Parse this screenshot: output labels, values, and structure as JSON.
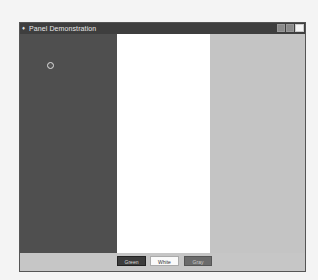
{
  "window": {
    "title": "Panel Demonstration",
    "controls": {
      "minimize": "_",
      "maximize": "□",
      "close": "×"
    }
  },
  "panels": [
    {
      "name": "left",
      "color": "#4f4f4f"
    },
    {
      "name": "center",
      "color": "#ffffff"
    },
    {
      "name": "right",
      "color": "#c4c4c4"
    }
  ],
  "buttons": {
    "green": "Green",
    "white": "White",
    "gray": "Gray"
  },
  "colors": {
    "titlebar": "#3e3e3e",
    "background": "#f4f4f4"
  }
}
